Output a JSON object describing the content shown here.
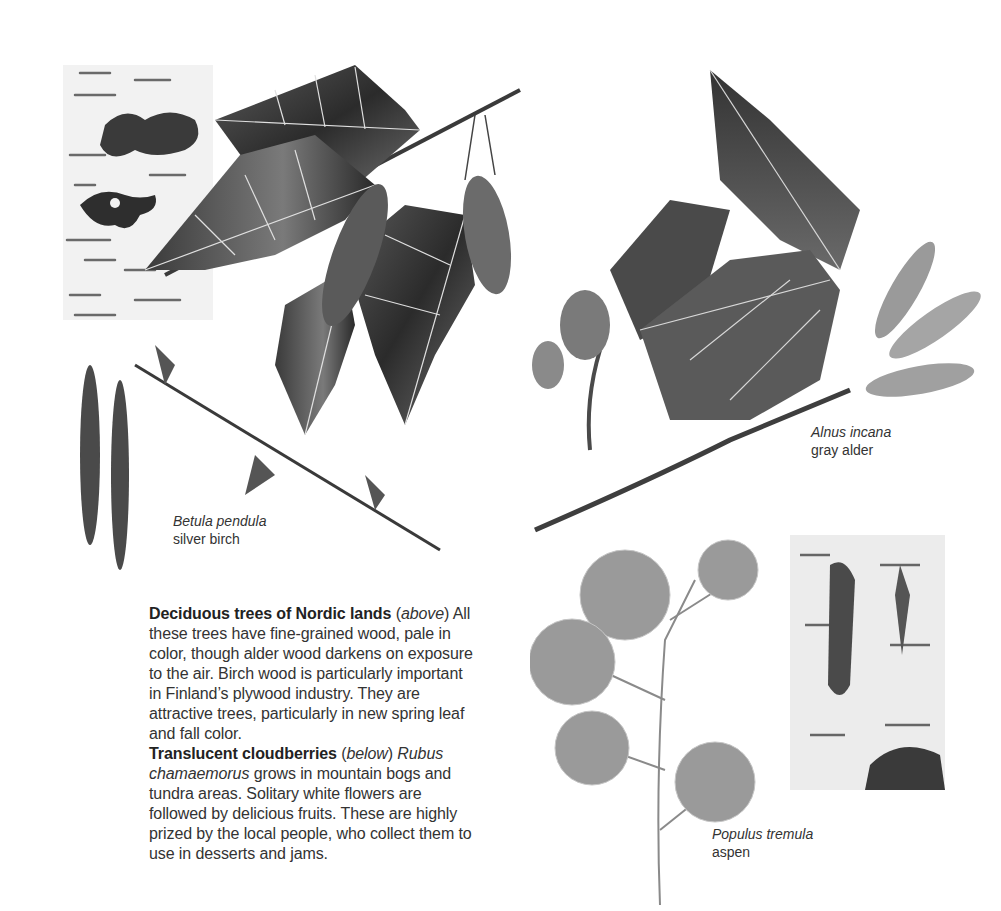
{
  "illustrations": [
    {
      "id": "birch",
      "label_scientific": "Betula pendula",
      "label_common": "silver birch"
    },
    {
      "id": "alder",
      "label_scientific": "Alnus incana",
      "label_common": "gray alder"
    },
    {
      "id": "aspen",
      "label_scientific": "Populus tremula",
      "label_common": "aspen"
    }
  ],
  "paragraphs": [
    {
      "heading": "Deciduous trees of Nordic lands",
      "ref": "above",
      "body": "All these trees have fine-grained wood, pale in color, though alder wood darkens on exposure to the air. Birch wood is particularly important in Finland’s plywood industry. They are attractive trees, particularly in new spring leaf and fall color."
    },
    {
      "heading": "Translucent cloudberries",
      "ref": "below",
      "species": "Rubus chamaemorus",
      "body": "grows in mountain bogs and tundra areas. Solitary white flowers are followed by delicious fruits. These are highly prized by the local people, who collect them to use in desserts and jams."
    }
  ]
}
